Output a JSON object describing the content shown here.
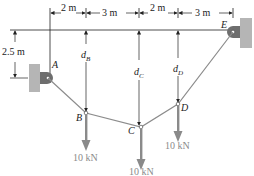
{
  "figure": {
    "dimensions": {
      "horizontal": [
        "2 m",
        "3 m",
        "2 m",
        "3 m"
      ],
      "vertical_A": "2.5 m"
    },
    "distances": {
      "dB": {
        "base": "d",
        "sub": "B"
      },
      "dC": {
        "base": "d",
        "sub": "C"
      },
      "dD": {
        "base": "d",
        "sub": "D"
      }
    },
    "points": {
      "A": "A",
      "B": "B",
      "C": "C",
      "D": "D",
      "E": "E"
    },
    "loads": {
      "B": "10 kN",
      "C": "10 kN",
      "D": "10 kN"
    },
    "colors": {
      "cable": "#8c8c8c",
      "load_arrow": "#8a8a8a",
      "support": "#b5b5b5",
      "support_dark": "#6e6e6e",
      "lines": "#222222"
    }
  }
}
